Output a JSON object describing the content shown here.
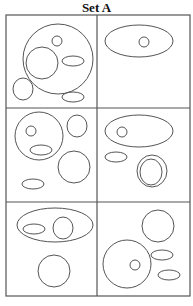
{
  "title": "Set A",
  "stroke_color": "#555555",
  "grid": {
    "x": 6,
    "y": 15,
    "width": 184,
    "height": 281,
    "col_split": 97,
    "row_splits": [
      108,
      202
    ]
  },
  "panels": [
    {
      "id": "panel-1",
      "shapes": [
        {
          "type": "circle",
          "cx": 58,
          "cy": 59,
          "r": 35
        },
        {
          "type": "circle",
          "cx": 57,
          "cy": 41,
          "r": 5
        },
        {
          "type": "circle",
          "cx": 42,
          "cy": 63,
          "r": 16
        },
        {
          "type": "ellipse",
          "cx": 73,
          "cy": 61,
          "rx": 11,
          "ry": 5
        },
        {
          "type": "ellipse",
          "cx": 23,
          "cy": 89,
          "rx": 10,
          "ry": 11
        },
        {
          "type": "ellipse",
          "cx": 73,
          "cy": 97,
          "rx": 11,
          "ry": 5
        }
      ]
    },
    {
      "id": "panel-2",
      "shapes": [
        {
          "type": "ellipse",
          "cx": 139,
          "cy": 41,
          "rx": 34,
          "ry": 16
        },
        {
          "type": "circle",
          "cx": 144,
          "cy": 42,
          "r": 5
        }
      ]
    },
    {
      "id": "panel-3",
      "shapes": [
        {
          "type": "circle",
          "cx": 39,
          "cy": 136,
          "r": 24
        },
        {
          "type": "circle",
          "cx": 31,
          "cy": 131,
          "r": 5
        },
        {
          "type": "ellipse",
          "cx": 41,
          "cy": 150,
          "rx": 11,
          "ry": 5
        },
        {
          "type": "ellipse",
          "cx": 77,
          "cy": 126,
          "rx": 10,
          "ry": 11
        },
        {
          "type": "circle",
          "cx": 74,
          "cy": 167,
          "r": 16
        },
        {
          "type": "ellipse",
          "cx": 33,
          "cy": 184,
          "rx": 11,
          "ry": 5
        }
      ]
    },
    {
      "id": "panel-4",
      "shapes": [
        {
          "type": "ellipse",
          "cx": 139,
          "cy": 131,
          "rx": 34,
          "ry": 16
        },
        {
          "type": "circle",
          "cx": 122,
          "cy": 132,
          "r": 5
        },
        {
          "type": "ellipse",
          "cx": 116,
          "cy": 157,
          "rx": 11,
          "ry": 5
        },
        {
          "type": "ellipse",
          "cx": 152,
          "cy": 171,
          "rx": 15,
          "ry": 16
        },
        {
          "type": "ellipse",
          "cx": 151,
          "cy": 172,
          "rx": 11,
          "ry": 13
        }
      ]
    },
    {
      "id": "panel-5",
      "shapes": [
        {
          "type": "ellipse",
          "cx": 55,
          "cy": 225,
          "rx": 38,
          "ry": 17
        },
        {
          "type": "ellipse",
          "cx": 34,
          "cy": 229,
          "rx": 11,
          "ry": 5
        },
        {
          "type": "ellipse",
          "cx": 63,
          "cy": 228,
          "rx": 10,
          "ry": 11
        },
        {
          "type": "circle",
          "cx": 54,
          "cy": 271,
          "r": 16
        }
      ]
    },
    {
      "id": "panel-6",
      "shapes": [
        {
          "type": "circle",
          "cx": 158,
          "cy": 226,
          "r": 16
        },
        {
          "type": "circle",
          "cx": 127,
          "cy": 264,
          "r": 24
        },
        {
          "type": "circle",
          "cx": 135,
          "cy": 265,
          "r": 5
        },
        {
          "type": "ellipse",
          "cx": 162,
          "cy": 255,
          "rx": 11,
          "ry": 5
        },
        {
          "type": "ellipse",
          "cx": 169,
          "cy": 275,
          "rx": 11,
          "ry": 5
        }
      ]
    }
  ]
}
